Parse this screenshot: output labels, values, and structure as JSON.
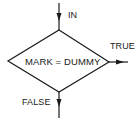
{
  "diagram": {
    "type": "flowchart-decision",
    "decision": {
      "label": "MARK = DUMMY",
      "shape": "diamond",
      "vertices": {
        "top": [
          59,
          30
        ],
        "right": [
          109,
          62
        ],
        "bottom": [
          59,
          92
        ],
        "left": [
          8,
          61
        ]
      }
    },
    "input": {
      "label": "IN",
      "from": [
        59,
        3
      ],
      "to": [
        59,
        30
      ]
    },
    "outputs": [
      {
        "label": "TRUE",
        "from": [
          109,
          62
        ],
        "to": [
          128,
          62
        ],
        "direction": "right"
      },
      {
        "label": "FALSE",
        "from": [
          59,
          92
        ],
        "to": [
          59,
          118
        ],
        "direction": "down"
      }
    ],
    "colors": {
      "stroke": "#1a1a1a",
      "background": "#ffffff",
      "text": "#1a1a1a"
    }
  }
}
